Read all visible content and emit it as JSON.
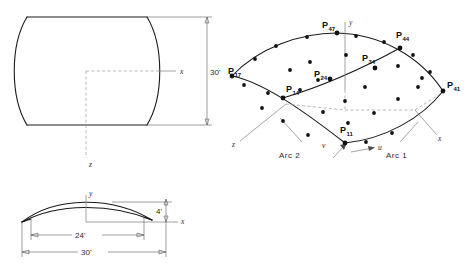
{
  "figure": {
    "line_color": "#1a1a1a",
    "dim_color": "#5a5a5a",
    "dash_color": "#9a9a9a",
    "dot_color": "#111111"
  },
  "left_view": {
    "name": "orthographic-views",
    "top_view": {
      "name": "plan-view",
      "axis_x_label": "x",
      "axis_z_label": "z",
      "dimension": {
        "value": "30'",
        "orientation": "vertical"
      }
    },
    "front_view": {
      "name": "elevation-view",
      "axis_x_label": "x",
      "axis_y_label": "y",
      "dimensions": [
        {
          "value": "24'",
          "orientation": "horizontal"
        },
        {
          "value": "30'",
          "orientation": "horizontal"
        },
        {
          "value": "4'",
          "orientation": "vertical"
        }
      ]
    }
  },
  "right_view": {
    "name": "surface-patch-3d",
    "axes": [
      {
        "id": "y-axis",
        "label": "y"
      },
      {
        "id": "x-axis",
        "label": "x"
      },
      {
        "id": "z-axis",
        "label": "z"
      },
      {
        "id": "u-param-axis",
        "label": "u"
      },
      {
        "id": "v-param-axis",
        "label": "v"
      }
    ],
    "annotations": [
      {
        "id": "arc-2-label",
        "label": "Arc 2"
      },
      {
        "id": "arc-1-label",
        "label": "Arc 1"
      }
    ],
    "control_points": [
      {
        "id": "p17",
        "base": "P",
        "sub": "17",
        "x": 232,
        "y": 76,
        "label_x": 228,
        "label_y": 74
      },
      {
        "id": "p47",
        "base": "P",
        "sub": "47",
        "x": 337,
        "y": 33,
        "label_x": 322,
        "label_y": 28
      },
      {
        "id": "p44",
        "base": "P",
        "sub": "44",
        "x": 400,
        "y": 48,
        "label_x": 396,
        "label_y": 38
      },
      {
        "id": "p41",
        "base": "P",
        "sub": "41",
        "x": 443,
        "y": 91,
        "label_x": 447,
        "label_y": 88
      },
      {
        "id": "p34",
        "base": "P",
        "sub": "34",
        "x": 375,
        "y": 68,
        "label_x": 362,
        "label_y": 61
      },
      {
        "id": "p24",
        "base": "P",
        "sub": "24",
        "x": 330,
        "y": 79,
        "label_x": 314,
        "label_y": 77
      },
      {
        "id": "p14",
        "base": "P",
        "sub": "14",
        "x": 283,
        "y": 98,
        "label_x": 286,
        "label_y": 92
      },
      {
        "id": "p11",
        "base": "P",
        "sub": "11",
        "x": 345,
        "y": 143,
        "label_x": 340,
        "label_y": 133
      }
    ],
    "net_dot_count": 28
  }
}
